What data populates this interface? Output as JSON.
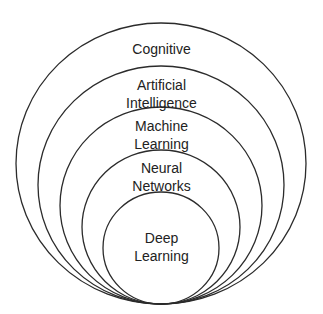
{
  "diagram": {
    "type": "nested-tangent-circles",
    "stroke_color": "#2b2b2b",
    "layers": [
      {
        "label_lines": [
          "Cognitive"
        ]
      },
      {
        "label_lines": [
          "Artificial",
          "Intelligence"
        ]
      },
      {
        "label_lines": [
          "Machine",
          "Learning"
        ]
      },
      {
        "label_lines": [
          "Neural",
          "Networks"
        ]
      },
      {
        "label_lines": [
          "Deep",
          "Learning"
        ]
      }
    ]
  }
}
